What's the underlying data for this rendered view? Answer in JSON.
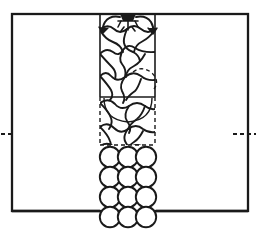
{
  "figure": {
    "domain_type": "diagram",
    "title": "",
    "background_color": "#ffffff",
    "stroke_color": "#1a1a1a",
    "width": 261,
    "height": 231
  },
  "outer_vessel": {
    "name": "vessel-outline",
    "shape": "rectangle",
    "x": 12,
    "y": 14,
    "width": 236,
    "height": 197,
    "line_style": "solid",
    "line_width": 2.2
  },
  "center_column": {
    "name": "central-column",
    "x": 100,
    "y": 14,
    "width": 55,
    "solid_bottom_y": 97,
    "dashed_bottom_y": 145,
    "upper_line_style": "solid",
    "lower_line_style": "dashed"
  },
  "internal_horizontal_line": {
    "name": "bed-surface-line",
    "x1": 100,
    "x2": 155,
    "y": 97,
    "line_style": "solid"
  },
  "dashed_region": {
    "name": "dashed-boundary-box",
    "x": 100,
    "y": 97,
    "width": 55,
    "height": 48,
    "line_style": "dashed"
  },
  "dashed_arc_upper": {
    "name": "dashed-arc-upper",
    "cx": 148,
    "cy": 78,
    "rx": 16,
    "ry": 14,
    "line_style": "dashed"
  },
  "solid_arc_lower": {
    "name": "solid-arc-lower-bubble",
    "cx": 128,
    "cy": 104,
    "rx": 24,
    "ry": 20,
    "line_style": "solid"
  },
  "texture": {
    "name": "bubble-mesh-texture",
    "description": "wavy interlocking cell pattern filling the central column",
    "rows": 6,
    "cols": 3,
    "cell_width": 18,
    "cell_height": 22,
    "region": {
      "x": 100,
      "y": 20,
      "width": 55,
      "height": 125
    }
  },
  "inlet_marker": {
    "name": "inlet-nozzle-symbol",
    "cx": 128,
    "cy": 19,
    "description": "small nozzle / sparger glyph at top center of column"
  },
  "flow_arrows": [
    {
      "name": "flow-arrow-left",
      "direction": "down-left",
      "start": {
        "x": 122,
        "y": 16
      },
      "end": {
        "x": 104,
        "y": 30
      }
    },
    {
      "name": "flow-arrow-right",
      "direction": "down-right",
      "start": {
        "x": 134,
        "y": 16
      },
      "end": {
        "x": 152,
        "y": 30
      }
    }
  ],
  "side_markers": [
    {
      "name": "level-marker-left",
      "side": "left",
      "y": 134,
      "x1": 2,
      "x2": 14,
      "line_style": "dashed"
    },
    {
      "name": "level-marker-right",
      "side": "right",
      "y": 134,
      "x1": 232,
      "x2": 252,
      "line_style": "dashed"
    }
  ],
  "particles": {
    "name": "particle-array",
    "shape": "circle",
    "rows": 4,
    "columns": 3,
    "radius": 10.2,
    "row_centers_y": [
      157,
      177,
      197,
      217
    ],
    "column_centers_x": [
      110,
      128,
      146
    ],
    "fill": "none",
    "stroke_width": 1.8,
    "count": 12
  },
  "annotations": {
    "left_label": "",
    "right_label": "",
    "bottom_label": ""
  }
}
